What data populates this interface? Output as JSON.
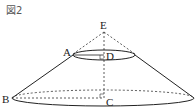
{
  "figure": {
    "title": "図2",
    "points": {
      "E": "E",
      "A": "A",
      "D": "D",
      "B": "B",
      "C": "C"
    },
    "colors": {
      "stroke": "#222222",
      "background": "#ffffff"
    }
  }
}
